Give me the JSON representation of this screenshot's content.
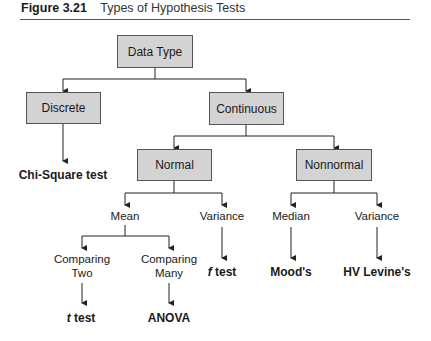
{
  "figure": {
    "number": "Figure 3.21",
    "title": "Types of Hypothesis Tests"
  },
  "nodes": {
    "root": "Data Type",
    "discrete": "Discrete",
    "continuous": "Continuous",
    "normal": "Normal",
    "nonnormal": "Nonnormal",
    "mean": "Mean",
    "variance_normal": "Variance",
    "median": "Median",
    "variance_nonnormal": "Variance",
    "comparing_two": [
      "Comparing",
      "Two"
    ],
    "comparing_many": [
      "Comparing",
      "Many"
    ]
  },
  "results": {
    "discrete": "Chi-Square test",
    "comparing_two_italic": "t",
    "comparing_two_rest": " test",
    "comparing_many": "ANOVA",
    "variance_normal_italic": "f",
    "variance_normal_rest": " test",
    "median": "Mood's",
    "variance_nonnormal": "HV Levine's"
  },
  "colors": {
    "box_fill": "#d3d3d3",
    "line": "#222222"
  }
}
